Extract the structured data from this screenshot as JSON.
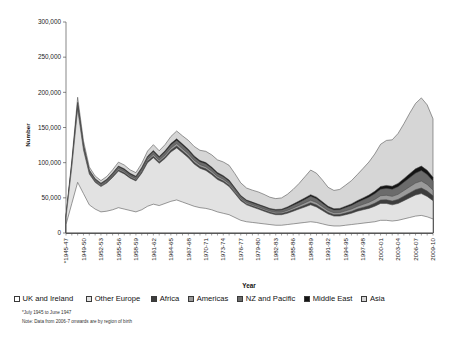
{
  "chart_data": {
    "type": "area",
    "stacked": true,
    "title": "",
    "xlabel": "Year",
    "ylabel": "Number",
    "ylim": [
      0,
      300000
    ],
    "ytick_labels": [
      "0",
      "50,000",
      "100,000",
      "150,000",
      "200,000",
      "250,000",
      "300,000"
    ],
    "ytick_values": [
      0,
      50000,
      100000,
      150000,
      200000,
      250000,
      300000
    ],
    "grid": false,
    "legend_position": "bottom",
    "x": [
      "*1945-47",
      "1947-48",
      "1948-49",
      "1949-50",
      "1950-51",
      "1951-52",
      "1952-53",
      "1953-54",
      "1954-55",
      "1955-56",
      "1956-57",
      "1957-58",
      "1958-59",
      "1959-60",
      "1960-61",
      "1961-62",
      "1962-63",
      "1963-64",
      "1964-65",
      "1965-66",
      "1966-67",
      "1967-68",
      "1968-69",
      "1969-70",
      "1970-71",
      "1971-72",
      "1972-73",
      "1973-74",
      "1974-75",
      "1975-76",
      "1976-77",
      "1977-78",
      "1978-79",
      "1979-80",
      "1980-81",
      "1981-82",
      "1982-83",
      "1983-84",
      "1984-85",
      "1985-86",
      "1986-87",
      "1987-88",
      "1988-89",
      "1989-90",
      "1990-91",
      "1991-92",
      "1992-93",
      "1993-94",
      "1994-95",
      "1995-96",
      "1996-97",
      "1997-98",
      "1998-99",
      "1999-00",
      "2000-01",
      "2001-02",
      "2002-03",
      "2003-04",
      "2004-05",
      "2005-06",
      "2006-07",
      "2007-08",
      "2008-09",
      "2009-10"
    ],
    "xtick_labels_shown": [
      "*1945-47",
      "1949-50",
      "1952-53",
      "1955-56",
      "1958-59",
      "1961-62",
      "1964-65",
      "1967-68",
      "1970-71",
      "1973-74",
      "1976-77",
      "1979-80",
      "1982-83",
      "1985-86",
      "1988-89",
      "1991-92",
      "1994-95",
      "1997-98",
      "2000-01",
      "2003-04",
      "2006-07",
      "2009-10"
    ],
    "xtick_label_stride": 3,
    "series": [
      {
        "name": "UK and Ireland",
        "color": "#ffffff",
        "values": [
          12000,
          42000,
          72000,
          56000,
          40000,
          34000,
          30000,
          31000,
          33000,
          36000,
          34000,
          32000,
          30000,
          33000,
          38000,
          41000,
          39000,
          42000,
          45000,
          47000,
          44000,
          41000,
          38000,
          36000,
          35000,
          33000,
          30000,
          28000,
          26000,
          22000,
          18000,
          16000,
          15000,
          14000,
          13000,
          12000,
          11000,
          11000,
          12000,
          13000,
          14000,
          15000,
          16000,
          15000,
          13000,
          11000,
          10000,
          10000,
          11000,
          12000,
          13000,
          14000,
          15000,
          16000,
          18000,
          18000,
          17000,
          18000,
          20000,
          22000,
          24000,
          25000,
          23000,
          20000
        ]
      },
      {
        "name": "Other Europe",
        "color": "#e2e2e2",
        "values": [
          10000,
          52000,
          104000,
          62000,
          44000,
          38000,
          36000,
          40000,
          46000,
          52000,
          50000,
          46000,
          44000,
          52000,
          62000,
          66000,
          60000,
          64000,
          70000,
          74000,
          70000,
          66000,
          60000,
          56000,
          54000,
          50000,
          46000,
          44000,
          40000,
          34000,
          28000,
          24000,
          22000,
          20000,
          18000,
          16000,
          15000,
          15000,
          16000,
          18000,
          20000,
          22000,
          24000,
          22000,
          19000,
          16000,
          14000,
          14000,
          15000,
          16000,
          18000,
          19000,
          20000,
          22000,
          24000,
          24000,
          23000,
          24000,
          26000,
          28000,
          30000,
          31000,
          29000,
          26000
        ]
      },
      {
        "name": "Africa",
        "color": "#3d3d3d",
        "values": [
          400,
          1200,
          2200,
          1600,
          1200,
          1100,
          1000,
          1100,
          1300,
          1500,
          1500,
          1400,
          1400,
          1600,
          1900,
          2100,
          2000,
          2200,
          2500,
          2700,
          2600,
          2500,
          2400,
          2300,
          2300,
          2200,
          2100,
          2000,
          1900,
          1700,
          1500,
          1400,
          1400,
          1400,
          1400,
          1400,
          1500,
          1600,
          1800,
          2000,
          2300,
          2600,
          2900,
          2800,
          2500,
          2200,
          2100,
          2200,
          2400,
          2700,
          3000,
          3400,
          3800,
          4300,
          4900,
          5200,
          5400,
          5800,
          6400,
          7000,
          7600,
          8000,
          7600,
          6800
        ]
      },
      {
        "name": "Americas",
        "color": "#9a9a9a",
        "values": [
          500,
          1500,
          2600,
          2000,
          1500,
          1400,
          1300,
          1400,
          1600,
          1900,
          1900,
          1800,
          1800,
          2100,
          2400,
          2700,
          2600,
          2800,
          3200,
          3400,
          3300,
          3200,
          3000,
          2900,
          2900,
          2800,
          2600,
          2500,
          2400,
          2200,
          1900,
          1800,
          1800,
          1800,
          1800,
          1800,
          1900,
          2000,
          2300,
          2600,
          2900,
          3300,
          3700,
          3600,
          3200,
          2800,
          2700,
          2800,
          3100,
          3400,
          3800,
          4300,
          4800,
          5400,
          6100,
          6500,
          6700,
          7200,
          7900,
          8700,
          9400,
          9900,
          9400,
          8400
        ]
      },
      {
        "name": "NZ and Pacific",
        "color": "#6b6b6b",
        "values": [
          600,
          2000,
          3600,
          2800,
          2100,
          1900,
          1800,
          2000,
          2300,
          2700,
          2700,
          2500,
          2500,
          3000,
          3500,
          3900,
          3700,
          4000,
          4500,
          4800,
          4700,
          4500,
          4300,
          4100,
          4100,
          4000,
          3700,
          3500,
          3400,
          3100,
          2700,
          2600,
          2600,
          2600,
          2600,
          2600,
          2800,
          3000,
          3400,
          3800,
          4300,
          4900,
          5500,
          5300,
          4700,
          4100,
          4000,
          4200,
          4600,
          5100,
          5700,
          6400,
          7200,
          8100,
          9100,
          9700,
          10000,
          10800,
          11800,
          13000,
          14100,
          14800,
          14100,
          12600
        ]
      },
      {
        "name": "Middle East",
        "color": "#141414",
        "values": [
          300,
          900,
          1600,
          1200,
          900,
          850,
          800,
          900,
          1000,
          1200,
          1200,
          1100,
          1100,
          1300,
          1500,
          1700,
          1600,
          1800,
          2000,
          2100,
          2000,
          2000,
          1900,
          1800,
          1800,
          1700,
          1600,
          1500,
          1500,
          1300,
          1200,
          1100,
          1100,
          1100,
          1100,
          1100,
          1200,
          1300,
          1500,
          1700,
          1900,
          2100,
          2400,
          2300,
          2100,
          1800,
          1700,
          1800,
          2000,
          2200,
          2500,
          2800,
          3100,
          3500,
          4000,
          4200,
          4400,
          4700,
          5200,
          5700,
          6100,
          6400,
          6100,
          5500
        ]
      },
      {
        "name": "Asia",
        "color": "#d6d6d6",
        "values": [
          1200,
          4000,
          7000,
          5500,
          4200,
          3800,
          3600,
          4000,
          4600,
          5400,
          5400,
          5000,
          5000,
          6000,
          7200,
          8200,
          8000,
          8800,
          10000,
          11000,
          11500,
          12500,
          13500,
          14500,
          16000,
          17500,
          18000,
          19500,
          21000,
          20000,
          18000,
          17000,
          17000,
          17500,
          17000,
          16000,
          15500,
          16000,
          18000,
          21000,
          25000,
          30000,
          35000,
          34000,
          31000,
          27000,
          26000,
          27000,
          30000,
          33000,
          37000,
          42000,
          47000,
          53000,
          60000,
          64000,
          66000,
          71000,
          78000,
          86000,
          93000,
          97000,
          93000,
          83000
        ]
      }
    ],
    "annotations": [
      "*July 1945 to June 1947",
      "Note: Data from 2006-7 onwards are by region of birth"
    ]
  },
  "axis": {
    "y_title": "Number",
    "x_title": "Year"
  },
  "legend": {
    "items": [
      {
        "label": "UK and Ireland",
        "color": "#ffffff"
      },
      {
        "label": "Other Europe",
        "color": "#e2e2e2"
      },
      {
        "label": "Africa",
        "color": "#3d3d3d"
      },
      {
        "label": "Americas",
        "color": "#9a9a9a"
      },
      {
        "label": "NZ and Pacific",
        "color": "#6b6b6b"
      },
      {
        "label": "Middle East",
        "color": "#141414"
      },
      {
        "label": "Asia",
        "color": "#d6d6d6"
      }
    ]
  },
  "footnotes": {
    "line1": "*July 1945 to June 1947",
    "line2": "Note: Data from 2006-7 onwards are by region of birth"
  }
}
